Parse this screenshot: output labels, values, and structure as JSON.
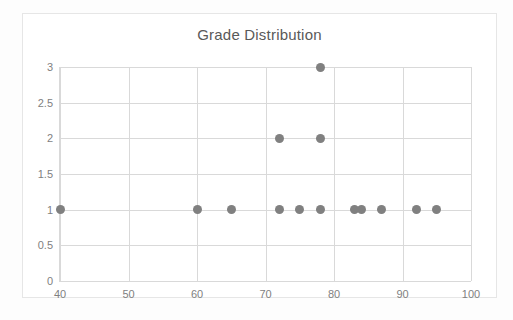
{
  "chart_data": {
    "type": "scatter",
    "title": "Grade Distribution",
    "xlabel": "",
    "ylabel": "",
    "xlim": [
      40,
      100
    ],
    "ylim": [
      0,
      3
    ],
    "grid": true,
    "legend": "none",
    "marker_color": "#808080",
    "gridline_color": "#d9d9d9",
    "tick_label_color": "#7f7f7f",
    "title_color": "#595959",
    "x_ticks": [
      "40",
      "50",
      "60",
      "70",
      "80",
      "90",
      "100"
    ],
    "x_tick_values": [
      40,
      50,
      60,
      70,
      80,
      90,
      100
    ],
    "y_ticks": [
      "0",
      "0.5",
      "1",
      "1.5",
      "2",
      "2.5",
      "3"
    ],
    "y_tick_values": [
      0,
      0.5,
      1,
      1.5,
      2,
      2.5,
      3
    ],
    "points": [
      {
        "x": 40,
        "y": 1
      },
      {
        "x": 60,
        "y": 1
      },
      {
        "x": 65,
        "y": 1
      },
      {
        "x": 72,
        "y": 1
      },
      {
        "x": 75,
        "y": 1
      },
      {
        "x": 78,
        "y": 1
      },
      {
        "x": 83,
        "y": 1
      },
      {
        "x": 84,
        "y": 1
      },
      {
        "x": 87,
        "y": 1
      },
      {
        "x": 92,
        "y": 1
      },
      {
        "x": 95,
        "y": 1
      },
      {
        "x": 72,
        "y": 2
      },
      {
        "x": 78,
        "y": 2
      },
      {
        "x": 78,
        "y": 3
      }
    ]
  }
}
